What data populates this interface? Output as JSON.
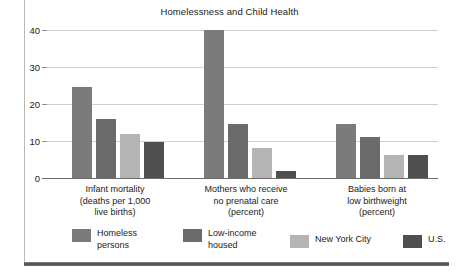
{
  "figure": {
    "title": "Homelessness and Child Health",
    "background": "#ffffff",
    "frame_color": "#b9b9b9",
    "rule_color": "#4c4c4c"
  },
  "chart_data": {
    "type": "bar",
    "title": "Homelessness and Child Health",
    "xlabel": "",
    "ylabel": "",
    "ylim": [
      0,
      40
    ],
    "yticks": [
      0,
      10,
      20,
      30,
      40
    ],
    "ytick_labels": [
      "0",
      "10",
      "20",
      "30",
      "40"
    ],
    "grid": true,
    "legend_position": "bottom",
    "categories": [
      "Infant mortality\n(deaths per 1,000\nlive births)",
      "Mothers who receive\nno prenatal care\n(percent)",
      "Babies born at\nlow birthweight\n(percent)"
    ],
    "series": [
      {
        "name": "Homeless\npersons",
        "legend_label": "Homeless\npersons",
        "color": "#7b7b7b",
        "values": [
          24.5,
          40.0,
          14.5
        ]
      },
      {
        "name": "Low-income\nhoused",
        "legend_label": "Low-income\nhoused",
        "color": "#6b6b6b",
        "values": [
          16.0,
          14.5,
          11.0
        ]
      },
      {
        "name": "New York City",
        "legend_label": "New York City",
        "color": "#b4b4b4",
        "values": [
          12.0,
          8.0,
          6.2
        ]
      },
      {
        "name": "U.S.",
        "legend_label": "U.S.",
        "color": "#4f4f4f",
        "values": [
          9.7,
          1.8,
          6.3
        ]
      }
    ]
  },
  "axis": {
    "tick_0": "0",
    "tick_10": "10",
    "tick_20": "20",
    "tick_30": "30",
    "tick_40": "40"
  },
  "categories": {
    "c0": "Infant mortality\n(deaths per 1,000\nlive births)",
    "c1": "Mothers who receive\nno prenatal care\n(percent)",
    "c2": "Babies born at\nlow birthweight\n(percent)"
  },
  "legend": {
    "l0": "Homeless\npersons",
    "l1": "Low-income\nhoused",
    "l2": "New York City",
    "l3": "U.S."
  }
}
